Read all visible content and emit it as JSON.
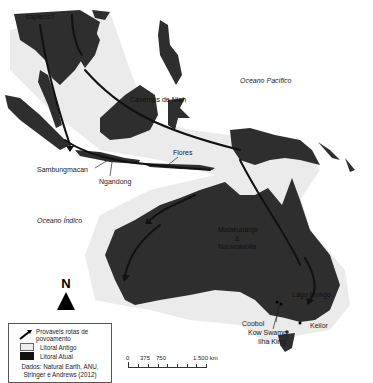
{
  "map": {
    "colors": {
      "sea": "#ffffff",
      "old_coast": "#ebebeb",
      "current_land": "#2e2e2e",
      "route": "#111111"
    },
    "labels": {
      "sapiens": "sapiens?",
      "niah": "Cavernas de Niah",
      "pacific": "Oceano Pacífico",
      "indian": "Oceano Índico",
      "flores": "Flores",
      "sambungmacan": "Sambungmacan",
      "ngandong": "Ngandong",
      "malakunanja": "Malakunanja",
      "and_sign": "&",
      "nauwalabila": "Nauwalabila",
      "lago_mungo": "Lago Mungo",
      "coobol": "Coobol",
      "kow_swamp": "Kow Swamp",
      "keilor": "Keilor",
      "ilha_king": "Ilha King"
    },
    "north_arrow": {
      "letter": "N",
      "icon": "north-arrow-icon"
    },
    "legend": {
      "routes": "Prováveis rotas de povoamento",
      "old_coast": "Litoral Antigo",
      "current_coast": "Litoral Atual",
      "source": "Dados: Natural Earth, ANU, Stringer e Andrews (2012)"
    },
    "scale_bar": {
      "labels": [
        "0",
        "375",
        "750",
        "1.500 km"
      ]
    }
  }
}
